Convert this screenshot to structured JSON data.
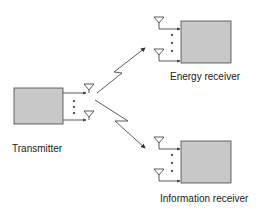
{
  "diagram": {
    "transmitter": {
      "label": "Transmitter"
    },
    "energy_receiver": {
      "label": "Energy receiver"
    },
    "information_receiver": {
      "label": "Information receiver"
    },
    "colors": {
      "box_fill": "#c8c8c8",
      "stroke": "#333333"
    }
  }
}
